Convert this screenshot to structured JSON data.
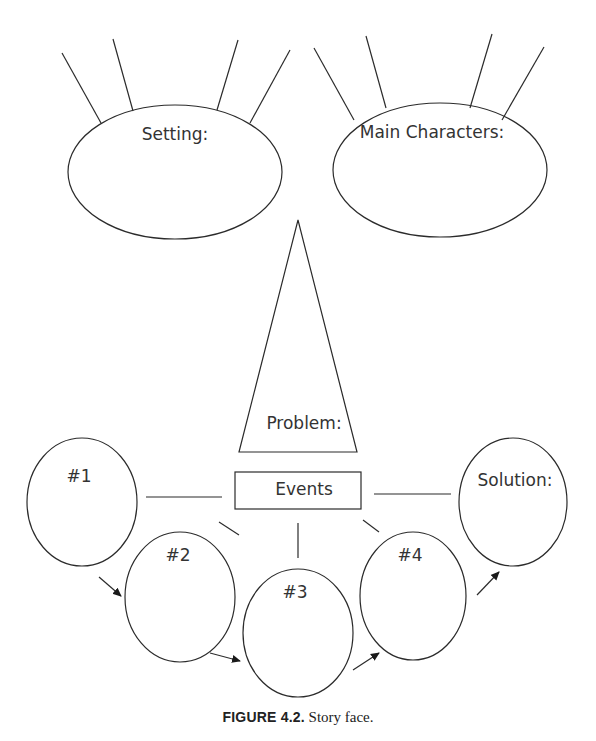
{
  "diagram": {
    "title": "Story face",
    "nodes": {
      "setting": {
        "label": "Setting:",
        "shape": "ellipse"
      },
      "main_characters": {
        "label": "Main Characters:",
        "shape": "ellipse"
      },
      "problem": {
        "label": "Problem:",
        "shape": "triangle"
      },
      "events": {
        "label": "Events",
        "shape": "rectangle"
      },
      "event_1": {
        "label": "#1",
        "shape": "ellipse"
      },
      "event_2": {
        "label": "#2",
        "shape": "ellipse"
      },
      "event_3": {
        "label": "#3",
        "shape": "ellipse"
      },
      "event_4": {
        "label": "#4",
        "shape": "ellipse"
      },
      "solution": {
        "label": "Solution:",
        "shape": "ellipse"
      }
    },
    "edges": [
      {
        "from": "events",
        "to": "event_1",
        "type": "line"
      },
      {
        "from": "events",
        "to": "event_2",
        "type": "line"
      },
      {
        "from": "events",
        "to": "event_3",
        "type": "line"
      },
      {
        "from": "events",
        "to": "event_4",
        "type": "line"
      },
      {
        "from": "events",
        "to": "solution",
        "type": "line"
      },
      {
        "from": "event_1",
        "to": "event_2",
        "type": "arrow"
      },
      {
        "from": "event_2",
        "to": "event_3",
        "type": "arrow"
      },
      {
        "from": "event_3",
        "to": "event_4",
        "type": "arrow"
      },
      {
        "from": "event_4",
        "to": "solution",
        "type": "arrow"
      }
    ],
    "decorations": {
      "setting_rays": 4,
      "main_characters_rays": 4
    },
    "stroke_color": "#2b2b2b"
  },
  "caption": {
    "figure_number": "FIGURE 4.2.",
    "text": "Story face."
  }
}
